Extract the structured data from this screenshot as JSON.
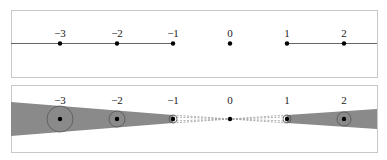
{
  "colors": {
    "frame": "#c8c8c8",
    "line": "#666666",
    "point": "#000000",
    "wedge": "#8a8a8a",
    "circle": "#555555",
    "dashed": "#9a9a9a"
  },
  "top_panel": {
    "points": [
      {
        "label": "−3",
        "x": 60
      },
      {
        "label": "−2",
        "x": 117
      },
      {
        "label": "−1",
        "x": 173
      },
      {
        "label": "0",
        "x": 230
      },
      {
        "label": "1",
        "x": 287
      },
      {
        "label": "2",
        "x": 344
      }
    ],
    "segments": [
      {
        "from": "left-edge",
        "to": "−1"
      },
      {
        "from": "1",
        "to": "right-edge"
      }
    ]
  },
  "bottom_panel": {
    "points": [
      {
        "label": "−3",
        "x": 60,
        "circle_r": 13
      },
      {
        "label": "−2",
        "x": 117,
        "circle_r": 8
      },
      {
        "label": "−1",
        "x": 173,
        "circle_r": 4
      },
      {
        "label": "0",
        "x": 230,
        "circle_r": 0
      },
      {
        "label": "1",
        "x": 287,
        "circle_r": 4
      },
      {
        "label": "2",
        "x": 344,
        "circle_r": 7
      }
    ],
    "wedges": [
      {
        "side": "left",
        "note": "shaded cone widening toward negative infinity"
      },
      {
        "side": "right",
        "note": "shaded cone widening toward positive infinity"
      }
    ],
    "dashed_note": "dashed cone lines converging to 0 between −1 and 1"
  }
}
